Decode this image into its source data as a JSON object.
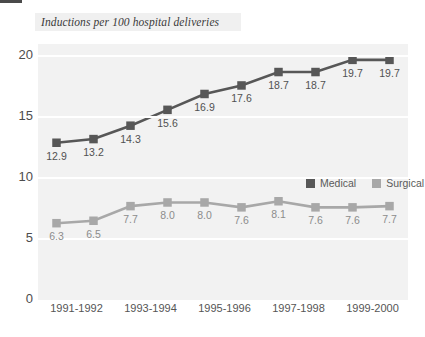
{
  "chart_data": {
    "type": "line",
    "title": "Inductions per 100 hospital deliveries",
    "xlabel": "",
    "ylabel": "",
    "ylim": [
      0,
      21
    ],
    "yticks": [
      "0",
      "5",
      "10",
      "15",
      "20"
    ],
    "ytick_values": [
      0,
      5,
      10,
      15,
      20
    ],
    "grid": "horizontal",
    "legend_position": "inside-right-middle",
    "x": [
      "1991-1992",
      "1992-1993",
      "1993-1994",
      "1994-1995",
      "1995-1996",
      "1996-1997",
      "1997-1998",
      "1998-1999",
      "1999-2000",
      "2000-2001"
    ],
    "xtick_labels": [
      "1991-1992",
      "1993-1994",
      "1995-1996",
      "1997-1998",
      "1999-2000"
    ],
    "xtick_indices": [
      0,
      2,
      4,
      6,
      8
    ],
    "series": [
      {
        "name": "Medical",
        "color": "#575757",
        "values": [
          12.9,
          13.2,
          14.3,
          15.6,
          16.9,
          17.6,
          18.7,
          18.7,
          19.7,
          19.7
        ],
        "labels": [
          "12.9",
          "13.2",
          "14.3",
          "15.6",
          "16.9",
          "17.6",
          "18.7",
          "18.7",
          "19.7",
          "19.7"
        ]
      },
      {
        "name": "Surgical",
        "color": "#a8a8a8",
        "values": [
          6.3,
          6.5,
          7.7,
          8.0,
          8.0,
          7.6,
          8.1,
          7.6,
          7.6,
          7.7
        ],
        "labels": [
          "6.3",
          "6.5",
          "7.7",
          "8.0",
          "8.0",
          "7.6",
          "8.1",
          "7.6",
          "7.6",
          "7.7"
        ]
      }
    ]
  },
  "legend": {
    "items": [
      {
        "label": "Medical",
        "color": "#575757"
      },
      {
        "label": "Surgical",
        "color": "#a8a8a8"
      }
    ]
  },
  "colors": {
    "medical": "#575757",
    "surgical": "#a8a8a8",
    "plot_background": "#f2f2f2",
    "gridline": "#ffffff",
    "title_background": "#f0f0f0",
    "axis_text": "#4d4d4d",
    "page_background": "#ffffff"
  }
}
